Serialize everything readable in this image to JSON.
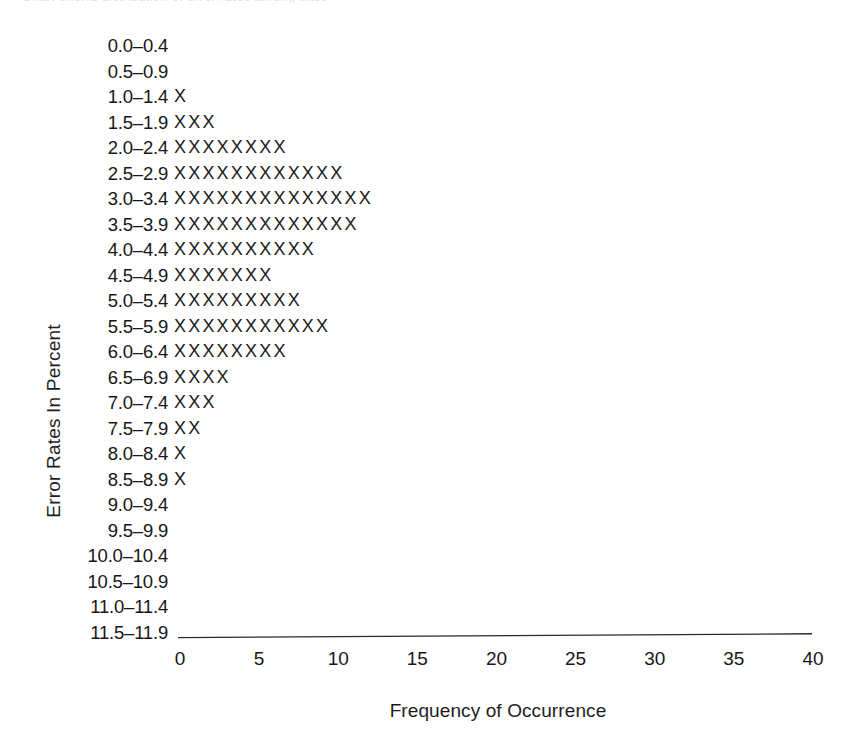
{
  "figure": {
    "caption_sliver": "Chart shows distribution of error rates among sites",
    "x_axis_title": "Frequency of Occurrence",
    "y_axis_title": "Error Rates In Percent",
    "mark_glyph": "X"
  },
  "chart_data": {
    "type": "bar",
    "orientation": "horizontal",
    "style": "dot-plot of X glyphs, one X per unit of frequency",
    "title": "",
    "xlabel": "Frequency of Occurrence",
    "ylabel": "Error Rates In Percent",
    "xlim": [
      0,
      40
    ],
    "xticks": [
      0,
      5,
      10,
      15,
      20,
      25,
      30,
      35,
      40
    ],
    "xticklabels": [
      "0",
      "5",
      "10",
      "15",
      "20",
      "25",
      "30",
      "35",
      "40"
    ],
    "grid": false,
    "legend": null,
    "categories": [
      "0.0–0.4",
      "0.5–0.9",
      "1.0–1.4",
      "1.5–1.9",
      "2.0–2.4",
      "2.5–2.9",
      "3.0–3.4",
      "3.5–3.9",
      "4.0–4.4",
      "4.5–4.9",
      "5.0–5.4",
      "5.5–5.9",
      "6.0–6.4",
      "6.5–6.9",
      "7.0–7.4",
      "7.5–7.9",
      "8.0–8.4",
      "8.5–8.9",
      "9.0–9.4",
      "9.5–9.9",
      "10.0–10.4",
      "10.5–10.9",
      "11.0–11.4",
      "11.5–11.9"
    ],
    "values": [
      0,
      0,
      1,
      3,
      8,
      12,
      14,
      13,
      10,
      7,
      9,
      11,
      8,
      4,
      3,
      2,
      1,
      1,
      0,
      0,
      0,
      0,
      0,
      0
    ]
  }
}
